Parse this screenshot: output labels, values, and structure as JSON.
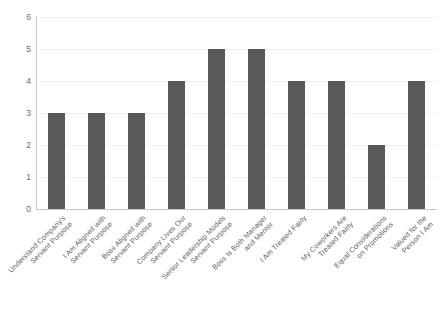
{
  "chart_data": {
    "type": "bar",
    "title": "",
    "subtitle": "",
    "xlabel": "",
    "ylabel": "",
    "ylim": [
      0,
      6
    ],
    "y_ticks": [
      0,
      1,
      2,
      3,
      4,
      5,
      6
    ],
    "grid": true,
    "legend": false,
    "legend_position": "none",
    "bar_color": "#595959",
    "categories": [
      "Understand Company's\nServant Purpose",
      "I Am Aligned with\nServant Purpose",
      "Boss Aligned with\nServant Purpose",
      "Company Lives Our\nServant Purpose",
      "Senior Leadership Models\nServant Purpose",
      "Boss Is Both Manager\nand Mentor",
      "I Am Treated Fairly",
      "My Coworkers Are\nTreated Fairly",
      "Equal Considerations\non Promotions",
      "Valued for the\nPerson I Am"
    ],
    "values": [
      3,
      3,
      3,
      4,
      5,
      5,
      4,
      4,
      2,
      4
    ]
  },
  "axis": {
    "y_tick_labels": [
      "0",
      "1",
      "2",
      "3",
      "4",
      "5",
      "6"
    ]
  }
}
